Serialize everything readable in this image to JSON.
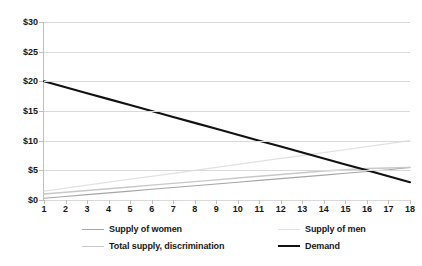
{
  "chart_data": {
    "type": "line",
    "title": "",
    "xlabel": "",
    "ylabel": "",
    "grid": true,
    "legend_position": "bottom",
    "x": [
      1,
      2,
      3,
      4,
      5,
      6,
      7,
      8,
      9,
      10,
      11,
      12,
      13,
      14,
      15,
      16,
      17,
      18
    ],
    "xticklabels": [
      "1",
      "2",
      "3",
      "4",
      "5",
      "6",
      "7",
      "8",
      "9",
      "10",
      "11",
      "12",
      "13",
      "14",
      "15",
      "16",
      "17",
      "18"
    ],
    "yticklabels": [
      "$0",
      "$5",
      "$10",
      "$15",
      "$20",
      "$25",
      "$30"
    ],
    "ytickvalues": [
      0,
      5,
      10,
      15,
      20,
      25,
      30
    ],
    "ylim": [
      0,
      30
    ],
    "xlim": [
      1,
      18
    ],
    "series": [
      {
        "name": "Supply of women",
        "color": "#a6a6a6",
        "width": 1.1,
        "values": [
          0.3,
          0.6,
          0.9,
          1.2,
          1.5,
          1.8,
          2.1,
          2.4,
          2.7,
          3.0,
          3.3,
          3.6,
          3.9,
          4.2,
          4.5,
          4.8,
          5.1,
          5.5
        ]
      },
      {
        "name": "Supply of men",
        "color": "#e2e2e2",
        "width": 1.3,
        "values": [
          1.5,
          2.0,
          2.5,
          3.0,
          3.5,
          4.0,
          4.5,
          5.0,
          5.5,
          6.0,
          6.5,
          7.0,
          7.5,
          8.0,
          8.5,
          9.0,
          9.5,
          10.0
        ]
      },
      {
        "name": "Total supply, discrimination",
        "color": "#c8c8c8",
        "width": 1.4,
        "values": [
          1.0,
          1.3,
          1.6,
          1.9,
          2.2,
          2.5,
          2.8,
          3.1,
          3.4,
          3.7,
          4.0,
          4.3,
          4.6,
          4.9,
          5.1,
          5.3,
          5.4,
          5.5
        ]
      },
      {
        "name": "Demand",
        "color": "#121212",
        "width": 2.1,
        "values": [
          20.0,
          19.0,
          18.0,
          17.0,
          16.0,
          15.0,
          14.0,
          13.0,
          12.0,
          11.0,
          10.0,
          9.0,
          8.0,
          7.0,
          6.0,
          5.0,
          4.0,
          3.0
        ]
      }
    ],
    "legend": [
      {
        "label": "Supply of women",
        "color": "#a6a6a6",
        "width": 1.1
      },
      {
        "label": "Supply of men",
        "color": "#e2e2e2",
        "width": 1.3
      },
      {
        "label": "Total supply, discrimination",
        "color": "#c8c8c8",
        "width": 1.4
      },
      {
        "label": "Demand",
        "color": "#121212",
        "width": 2.1
      }
    ]
  }
}
